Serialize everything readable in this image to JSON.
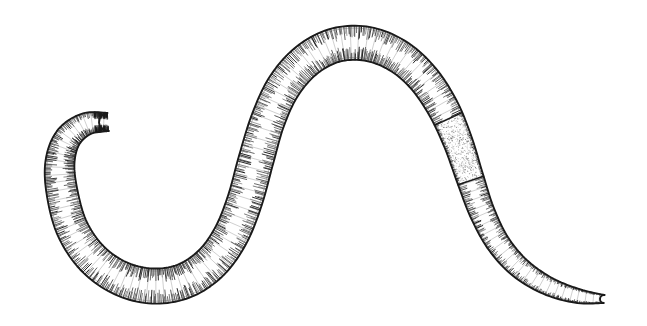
{
  "figure": {
    "title": "Earthworm line illustration",
    "subject": "earthworm",
    "style": "pen-and-ink hatched engraving",
    "orientation": "horizontal S-curve, head at left, tail at lower right",
    "background_color": "#ffffff",
    "ink_color": "#1a1a1a",
    "midtone_color": "#5a5a5a",
    "canvas": {
      "width": 647,
      "height": 326
    }
  },
  "drawing": {
    "type": "line-art",
    "centerline": [
      {
        "x": 108,
        "y": 122
      },
      {
        "x": 86,
        "y": 124
      },
      {
        "x": 68,
        "y": 138
      },
      {
        "x": 60,
        "y": 162
      },
      {
        "x": 62,
        "y": 192
      },
      {
        "x": 72,
        "y": 228
      },
      {
        "x": 92,
        "y": 258
      },
      {
        "x": 120,
        "y": 278
      },
      {
        "x": 152,
        "y": 286
      },
      {
        "x": 184,
        "y": 281
      },
      {
        "x": 211,
        "y": 263
      },
      {
        "x": 231,
        "y": 235
      },
      {
        "x": 245,
        "y": 200
      },
      {
        "x": 256,
        "y": 160
      },
      {
        "x": 268,
        "y": 120
      },
      {
        "x": 284,
        "y": 86
      },
      {
        "x": 307,
        "y": 60
      },
      {
        "x": 336,
        "y": 45
      },
      {
        "x": 368,
        "y": 44
      },
      {
        "x": 398,
        "y": 56
      },
      {
        "x": 423,
        "y": 78
      },
      {
        "x": 443,
        "y": 108
      },
      {
        "x": 458,
        "y": 142
      },
      {
        "x": 470,
        "y": 178
      },
      {
        "x": 482,
        "y": 212
      },
      {
        "x": 498,
        "y": 243
      },
      {
        "x": 520,
        "y": 268
      },
      {
        "x": 548,
        "y": 286
      },
      {
        "x": 578,
        "y": 296
      },
      {
        "x": 604,
        "y": 299
      }
    ],
    "half_widths": [
      9,
      11,
      13,
      14.5,
      15.5,
      16,
      16.5,
      17,
      17.5,
      17.5,
      17.5,
      17.5,
      17.5,
      17.5,
      17,
      17,
      17,
      17,
      17,
      16.5,
      16,
      15.5,
      14.5,
      13.5,
      12.5,
      11.5,
      10.5,
      9,
      7,
      4
    ],
    "segment_count": 118,
    "clitellum": {
      "label": "clitellum",
      "start_fraction": 0.735,
      "end_fraction": 0.795,
      "description": "smooth stippled band without segment rings"
    },
    "head": {
      "label": "anterior end",
      "x": 108,
      "y": 122
    },
    "tail": {
      "label": "posterior end",
      "x": 604,
      "y": 299
    },
    "bounds": {
      "left": 45,
      "top": 29,
      "right": 622,
      "bottom": 301
    }
  }
}
